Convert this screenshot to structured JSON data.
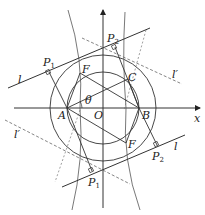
{
  "diagram": {
    "type": "geometry",
    "axes": {
      "x_label": "x",
      "origin_label": "O"
    },
    "points": {
      "A": "A",
      "B": "B",
      "C": "C",
      "O": "O",
      "F_top": "F",
      "F_bottom": "F",
      "P1_top": "P",
      "P1_top_sub": "1",
      "P2_top": "P",
      "P2_top_sub": "2",
      "P1_bottom": "P",
      "P1_bottom_sub": "1",
      "P2_bottom": "P",
      "P2_bottom_sub": "2"
    },
    "lines": {
      "l_top": "l",
      "l_bottom": "l",
      "lprime_right": "l′",
      "lprime_left": "l′"
    },
    "angle": "θ",
    "colors": {
      "stroke": "#333333",
      "dashed": "#666666"
    }
  }
}
